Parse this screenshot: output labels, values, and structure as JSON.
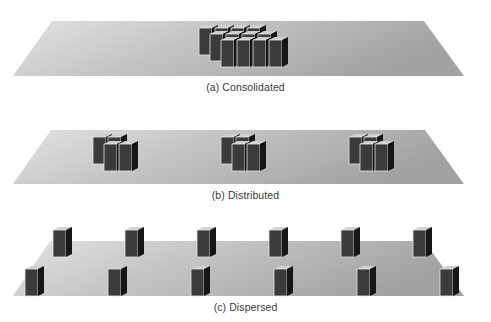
{
  "figure": {
    "panels": [
      {
        "id": "a",
        "caption": "(a) Consolidated",
        "layout": "consolidated",
        "server_groups": 1,
        "servers_per_group": 12,
        "grid": {
          "rows": 3,
          "cols": 4
        }
      },
      {
        "id": "b",
        "caption": "(b) Distributed",
        "layout": "distributed",
        "server_groups": 3,
        "servers_per_group": 4
      },
      {
        "id": "c",
        "caption": "(c) Dispersed",
        "layout": "dispersed",
        "server_groups": 12,
        "servers_per_group": 1,
        "rows": 2,
        "per_row": 6
      }
    ],
    "icons": {
      "plane": "floor-plane",
      "server": "server-tower-icon"
    },
    "colors": {
      "plane_light": "#dcdcdc",
      "plane_dark": "#a4a4a4",
      "server_top": "#c8c8c8",
      "server_left": "#3c3c3c",
      "server_front": "#1a1a1a",
      "server_edge": "#e8e8e8",
      "caption": "#3a3a3a"
    }
  }
}
